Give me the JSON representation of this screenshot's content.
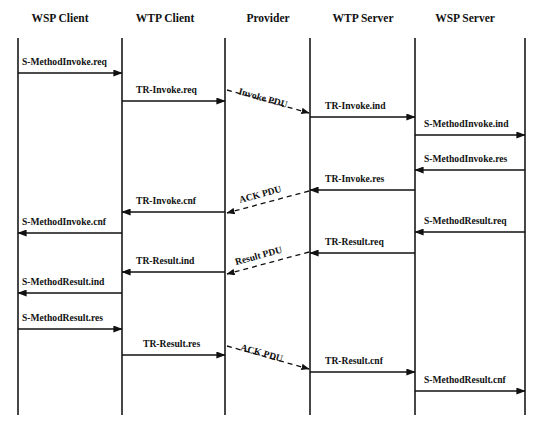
{
  "diagram": {
    "type": "sequence-diagram",
    "background_color": "#ffffff",
    "line_color": "#111111",
    "lifelines": [
      {
        "id": "wsp-client",
        "label": "WSP Client",
        "x": 18,
        "label_x": 60
      },
      {
        "id": "wtp-client",
        "label": "WTP Client",
        "x": 122,
        "label_x": 165
      },
      {
        "id": "provider",
        "label": "Provider",
        "x": 225,
        "label_x": 268
      },
      {
        "id": "wtp-server",
        "label": "WTP Server",
        "x": 310,
        "label_x": 363
      },
      {
        "id": "wsp-server",
        "label": "WSP Server",
        "x": 415,
        "label_x": 465
      },
      {
        "id": "wsp-server-right",
        "label": "",
        "x": 525,
        "label_x": 525
      }
    ],
    "lifeline_top": 38,
    "lifeline_bottom": 415,
    "header_baseline": 22,
    "messages": [
      {
        "id": "m1",
        "label": "S-MethodInvoke.req",
        "from_x": 18,
        "to_x": 122,
        "y": 73,
        "dir": "right",
        "label_x": 22,
        "label_y": 65
      },
      {
        "id": "m2",
        "label": "TR-Invoke.req",
        "from_x": 122,
        "to_x": 225,
        "y": 101,
        "dir": "right",
        "label_x": 136,
        "label_y": 93
      },
      {
        "id": "m3",
        "label": "TR-Invoke.ind",
        "from_x": 310,
        "to_x": 415,
        "y": 117,
        "dir": "right",
        "label_x": 325,
        "label_y": 109
      },
      {
        "id": "m4",
        "label": "S-MethodInvoke.ind",
        "from_x": 415,
        "to_x": 525,
        "y": 135,
        "dir": "right",
        "label_x": 424,
        "label_y": 127
      },
      {
        "id": "m5",
        "label": "S-MethodInvoke.res",
        "from_x": 525,
        "to_x": 415,
        "y": 170,
        "dir": "left",
        "label_x": 424,
        "label_y": 162
      },
      {
        "id": "m6",
        "label": "TR-Invoke.res",
        "from_x": 415,
        "to_x": 310,
        "y": 190,
        "dir": "left",
        "label_x": 325,
        "label_y": 182
      },
      {
        "id": "m7",
        "label": "TR-Invoke.cnf",
        "from_x": 225,
        "to_x": 122,
        "y": 212,
        "dir": "left",
        "label_x": 136,
        "label_y": 204
      },
      {
        "id": "m8",
        "label": "S-MethodInvoke.cnf",
        "from_x": 122,
        "to_x": 18,
        "y": 233,
        "dir": "left",
        "label_x": 22,
        "label_y": 225
      },
      {
        "id": "m9",
        "label": "S-MethodResult.req",
        "from_x": 525,
        "to_x": 415,
        "y": 232,
        "dir": "left",
        "label_x": 424,
        "label_y": 224
      },
      {
        "id": "m10",
        "label": "TR-Result.req",
        "from_x": 415,
        "to_x": 310,
        "y": 253,
        "dir": "left",
        "label_x": 325,
        "label_y": 245
      },
      {
        "id": "m11",
        "label": "TR-Result.ind",
        "from_x": 225,
        "to_x": 122,
        "y": 272,
        "dir": "left",
        "label_x": 136,
        "label_y": 264
      },
      {
        "id": "m12",
        "label": "S-MethodResult.ind",
        "from_x": 122,
        "to_x": 18,
        "y": 293,
        "dir": "left",
        "label_x": 22,
        "label_y": 285
      },
      {
        "id": "m13",
        "label": "S-MethodResult.res",
        "from_x": 18,
        "to_x": 122,
        "y": 329,
        "dir": "right",
        "label_x": 22,
        "label_y": 321
      },
      {
        "id": "m14",
        "label": "TR-Result.res",
        "from_x": 122,
        "to_x": 225,
        "y": 355,
        "dir": "right",
        "label_x": 143,
        "label_y": 347
      },
      {
        "id": "m15",
        "label": "TR-Result.cnf",
        "from_x": 310,
        "to_x": 415,
        "y": 372,
        "dir": "right",
        "label_x": 325,
        "label_y": 364
      },
      {
        "id": "m16",
        "label": "S-MethodResult.cnf",
        "from_x": 415,
        "to_x": 525,
        "y": 391,
        "dir": "right",
        "label_x": 424,
        "label_y": 383
      }
    ],
    "pdu_messages": [
      {
        "id": "p1",
        "label": "Invoke PDU",
        "x1": 227,
        "y1": 90,
        "x2": 309,
        "y2": 113,
        "arrow_at": "end",
        "label_x": 238,
        "label_y": 94,
        "rotation": 16
      },
      {
        "id": "p2",
        "label": "ACK PDU",
        "x1": 309,
        "y1": 191,
        "x2": 227,
        "y2": 213,
        "arrow_at": "end",
        "label_x": 240,
        "label_y": 203,
        "rotation": -15
      },
      {
        "id": "p3",
        "label": "Result PDU",
        "x1": 309,
        "y1": 252,
        "x2": 227,
        "y2": 274,
        "arrow_at": "end",
        "label_x": 236,
        "label_y": 265,
        "rotation": -15
      },
      {
        "id": "p4",
        "label": "ACK PDU",
        "x1": 227,
        "y1": 346,
        "x2": 309,
        "y2": 369,
        "arrow_at": "end",
        "label_x": 240,
        "label_y": 350,
        "rotation": 16
      }
    ]
  }
}
